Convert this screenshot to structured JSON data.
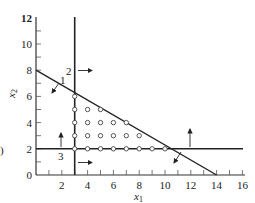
{
  "figure": {
    "xlabel": "x",
    "xlabel_sub": "1",
    "ylabel": "x",
    "ylabel_sub": "2",
    "left_fragment": ")",
    "x_ticks": [
      "2",
      "4",
      "6",
      "8",
      "10",
      "12",
      "14",
      "16"
    ],
    "y_ticks": [
      "0",
      "2",
      "4",
      "6",
      "8",
      "10",
      "12"
    ],
    "constraint_labels": [
      "1",
      "2",
      "3"
    ]
  },
  "chart_data": {
    "type": "scatter",
    "title": "",
    "xlabel": "x1",
    "ylabel": "x2",
    "xlim": [
      0,
      16
    ],
    "ylim": [
      0,
      12
    ],
    "x_ticks": [
      2,
      4,
      6,
      8,
      10,
      12,
      14,
      16
    ],
    "y_ticks": [
      0,
      2,
      4,
      6,
      8,
      10,
      12
    ],
    "grid": false,
    "constraints": [
      {
        "label": "1",
        "line": "from (0,8) to (14,0)",
        "feasible_direction": "down-left"
      },
      {
        "label": "2",
        "line": "x1 = 3",
        "feasible_direction": "right"
      },
      {
        "label": "3",
        "line": "x2 = 2",
        "feasible_direction": "up"
      }
    ],
    "integer_points": [
      [
        3,
        6
      ],
      [
        3,
        5
      ],
      [
        4,
        5
      ],
      [
        5,
        5
      ],
      [
        3,
        4
      ],
      [
        4,
        4
      ],
      [
        5,
        4
      ],
      [
        6,
        4
      ],
      [
        7,
        4
      ],
      [
        3,
        3
      ],
      [
        4,
        3
      ],
      [
        5,
        3
      ],
      [
        6,
        3
      ],
      [
        7,
        3
      ],
      [
        8,
        3
      ],
      [
        3,
        2
      ],
      [
        4,
        2
      ],
      [
        5,
        2
      ],
      [
        6,
        2
      ],
      [
        7,
        2
      ],
      [
        8,
        2
      ],
      [
        9,
        2
      ],
      [
        10,
        2
      ]
    ]
  }
}
